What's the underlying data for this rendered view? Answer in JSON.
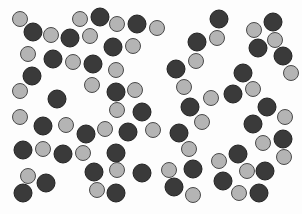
{
  "image": {
    "width": 302,
    "height": 214,
    "background": "#fdfdfd",
    "description": "Scattered dark and light gray circles on a white background"
  },
  "styles": {
    "dark": {
      "fill": "#3a3a3a",
      "stroke": "#222222",
      "r": 9
    },
    "light": {
      "fill": "#b4b4b4",
      "stroke": "#4a4a4a",
      "r": 7.5
    }
  },
  "counts": {
    "dark": 44,
    "light": 41
  },
  "circles": [
    {
      "x": 20,
      "y": 19,
      "t": "light"
    },
    {
      "x": 33,
      "y": 32,
      "t": "dark"
    },
    {
      "x": 51,
      "y": 35,
      "t": "light"
    },
    {
      "x": 70,
      "y": 38,
      "t": "dark"
    },
    {
      "x": 80,
      "y": 19,
      "t": "light"
    },
    {
      "x": 100,
      "y": 17,
      "t": "dark"
    },
    {
      "x": 90,
      "y": 36,
      "t": "light"
    },
    {
      "x": 117,
      "y": 24,
      "t": "light"
    },
    {
      "x": 137,
      "y": 24,
      "t": "dark"
    },
    {
      "x": 157,
      "y": 28,
      "t": "light"
    },
    {
      "x": 113,
      "y": 47,
      "t": "dark"
    },
    {
      "x": 133,
      "y": 46,
      "t": "light"
    },
    {
      "x": 28,
      "y": 54,
      "t": "light"
    },
    {
      "x": 53,
      "y": 59,
      "t": "dark"
    },
    {
      "x": 73,
      "y": 62,
      "t": "light"
    },
    {
      "x": 93,
      "y": 64,
      "t": "dark"
    },
    {
      "x": 116,
      "y": 70,
      "t": "light"
    },
    {
      "x": 32,
      "y": 76,
      "t": "dark"
    },
    {
      "x": 20,
      "y": 91,
      "t": "light"
    },
    {
      "x": 92,
      "y": 85,
      "t": "light"
    },
    {
      "x": 57,
      "y": 99,
      "t": "dark"
    },
    {
      "x": 116,
      "y": 92,
      "t": "dark"
    },
    {
      "x": 135,
      "y": 90,
      "t": "light"
    },
    {
      "x": 117,
      "y": 110,
      "t": "light"
    },
    {
      "x": 142,
      "y": 112,
      "t": "dark"
    },
    {
      "x": 20,
      "y": 117,
      "t": "light"
    },
    {
      "x": 43,
      "y": 126,
      "t": "dark"
    },
    {
      "x": 66,
      "y": 125,
      "t": "light"
    },
    {
      "x": 86,
      "y": 134,
      "t": "dark"
    },
    {
      "x": 105,
      "y": 129,
      "t": "light"
    },
    {
      "x": 128,
      "y": 132,
      "t": "dark"
    },
    {
      "x": 153,
      "y": 130,
      "t": "light"
    },
    {
      "x": 23,
      "y": 150,
      "t": "dark"
    },
    {
      "x": 43,
      "y": 149,
      "t": "light"
    },
    {
      "x": 63,
      "y": 154,
      "t": "dark"
    },
    {
      "x": 83,
      "y": 153,
      "t": "light"
    },
    {
      "x": 116,
      "y": 153,
      "t": "dark"
    },
    {
      "x": 94,
      "y": 172,
      "t": "dark"
    },
    {
      "x": 117,
      "y": 170,
      "t": "light"
    },
    {
      "x": 142,
      "y": 173,
      "t": "dark"
    },
    {
      "x": 28,
      "y": 176,
      "t": "light"
    },
    {
      "x": 46,
      "y": 183,
      "t": "dark"
    },
    {
      "x": 23,
      "y": 193,
      "t": "dark"
    },
    {
      "x": 97,
      "y": 190,
      "t": "light"
    },
    {
      "x": 116,
      "y": 193,
      "t": "dark"
    },
    {
      "x": 219,
      "y": 19,
      "t": "dark"
    },
    {
      "x": 217,
      "y": 38,
      "t": "light"
    },
    {
      "x": 254,
      "y": 30,
      "t": "light"
    },
    {
      "x": 273,
      "y": 22,
      "t": "dark"
    },
    {
      "x": 275,
      "y": 40,
      "t": "light"
    },
    {
      "x": 197,
      "y": 42,
      "t": "dark"
    },
    {
      "x": 258,
      "y": 48,
      "t": "dark"
    },
    {
      "x": 283,
      "y": 56,
      "t": "dark"
    },
    {
      "x": 196,
      "y": 61,
      "t": "light"
    },
    {
      "x": 176,
      "y": 69,
      "t": "dark"
    },
    {
      "x": 291,
      "y": 73,
      "t": "light"
    },
    {
      "x": 243,
      "y": 73,
      "t": "dark"
    },
    {
      "x": 184,
      "y": 87,
      "t": "light"
    },
    {
      "x": 253,
      "y": 89,
      "t": "light"
    },
    {
      "x": 233,
      "y": 94,
      "t": "dark"
    },
    {
      "x": 211,
      "y": 98,
      "t": "light"
    },
    {
      "x": 190,
      "y": 107,
      "t": "dark"
    },
    {
      "x": 267,
      "y": 107,
      "t": "dark"
    },
    {
      "x": 285,
      "y": 117,
      "t": "light"
    },
    {
      "x": 202,
      "y": 122,
      "t": "light"
    },
    {
      "x": 253,
      "y": 124,
      "t": "dark"
    },
    {
      "x": 179,
      "y": 133,
      "t": "dark"
    },
    {
      "x": 263,
      "y": 143,
      "t": "light"
    },
    {
      "x": 283,
      "y": 139,
      "t": "dark"
    },
    {
      "x": 189,
      "y": 149,
      "t": "light"
    },
    {
      "x": 238,
      "y": 154,
      "t": "dark"
    },
    {
      "x": 284,
      "y": 157,
      "t": "light"
    },
    {
      "x": 219,
      "y": 161,
      "t": "light"
    },
    {
      "x": 193,
      "y": 169,
      "t": "dark"
    },
    {
      "x": 169,
      "y": 170,
      "t": "light"
    },
    {
      "x": 247,
      "y": 171,
      "t": "light"
    },
    {
      "x": 265,
      "y": 171,
      "t": "dark"
    },
    {
      "x": 174,
      "y": 187,
      "t": "dark"
    },
    {
      "x": 223,
      "y": 181,
      "t": "dark"
    },
    {
      "x": 193,
      "y": 195,
      "t": "light"
    },
    {
      "x": 239,
      "y": 193,
      "t": "light"
    },
    {
      "x": 259,
      "y": 193,
      "t": "dark"
    }
  ]
}
